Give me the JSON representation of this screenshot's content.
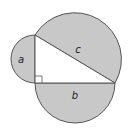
{
  "diagram": {
    "labels": {
      "a": "a",
      "b": "b",
      "c": "c"
    },
    "colors": {
      "fill": "#c8c8c8",
      "stroke": "#555555",
      "triangle": "#ffffff"
    }
  }
}
